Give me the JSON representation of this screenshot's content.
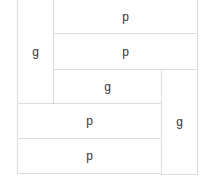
{
  "diagram": {
    "type": "grid-layout",
    "cells": [
      {
        "id": "left-g",
        "label": "g",
        "x": 17,
        "y": -1,
        "w": 37,
        "h": 105
      },
      {
        "id": "top-p",
        "label": "p",
        "x": 53,
        "y": -1,
        "w": 145,
        "h": 35
      },
      {
        "id": "second-p",
        "label": "p",
        "x": 53,
        "y": 33,
        "w": 145,
        "h": 37
      },
      {
        "id": "middle-g",
        "label": "g",
        "x": 53,
        "y": 69,
        "w": 109,
        "h": 35
      },
      {
        "id": "right-g",
        "label": "g",
        "x": 161,
        "y": 69,
        "w": 37,
        "h": 106
      },
      {
        "id": "lower-p",
        "label": "p",
        "x": 17,
        "y": 103,
        "w": 145,
        "h": 36
      },
      {
        "id": "bottom-p",
        "label": "p",
        "x": 17,
        "y": 138,
        "w": 145,
        "h": 36
      }
    ],
    "colors": {
      "border": "#dcdcdc",
      "text": "#333333",
      "background": "#ffffff"
    }
  }
}
